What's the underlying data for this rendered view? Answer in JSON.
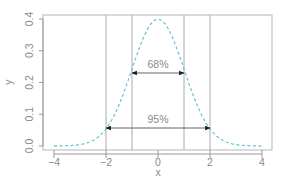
{
  "chart_data": {
    "type": "line",
    "title": "",
    "xlabel": "x",
    "ylabel": "y",
    "xlim": [
      -4,
      4
    ],
    "ylim": [
      0,
      0.4
    ],
    "x_ticks": [
      -4,
      -2,
      0,
      2,
      4
    ],
    "x_tick_labels": [
      "−4",
      "−2",
      "0",
      "2",
      "4"
    ],
    "y_ticks": [
      0.0,
      0.1,
      0.2,
      0.3,
      0.4
    ],
    "y_tick_labels": [
      "0.0",
      "0.1",
      "0.2",
      "0.3",
      "0.4"
    ],
    "grid": false,
    "series": [
      {
        "name": "Standard normal density",
        "style": "dashed",
        "color": "#5fc4d0",
        "x": [
          -3.5,
          -3,
          -2.5,
          -2,
          -1.5,
          -1,
          -0.5,
          0,
          0.5,
          1,
          1.5,
          2,
          2.5,
          3,
          3.5
        ],
        "y": [
          0.001,
          0.004,
          0.018,
          0.054,
          0.13,
          0.242,
          0.352,
          0.399,
          0.352,
          0.242,
          0.13,
          0.054,
          0.018,
          0.004,
          0.001
        ]
      }
    ],
    "vertical_lines": [
      -2,
      -1,
      1,
      2
    ],
    "annotations": [
      {
        "label": "68%",
        "from_x": -1,
        "to_x": 1,
        "y": 0.23,
        "type": "double-arrow"
      },
      {
        "label": "95%",
        "from_x": -2,
        "to_x": 2,
        "y": 0.054,
        "type": "double-arrow"
      }
    ]
  },
  "colors": {
    "curve": "#5fc4d0",
    "axis": "#9a9a9a",
    "text": "#8a8a8a",
    "arrow": "#1a1a1a",
    "vline": "#aaaaaa"
  }
}
